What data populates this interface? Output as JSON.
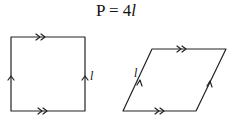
{
  "formula": {
    "lhs": "P = 4",
    "var": "l"
  },
  "figures": [
    {
      "name": "square",
      "side_label": "l",
      "marks": "parallel arrows: double on top and bottom, single on left and right"
    },
    {
      "name": "rhombus",
      "side_label": "l",
      "marks": "parallel arrows: double on top and bottom, single on slanted sides"
    }
  ],
  "colors": {
    "stroke": "#222222",
    "background": "#ffffff"
  }
}
